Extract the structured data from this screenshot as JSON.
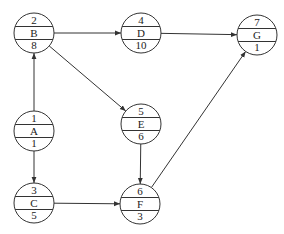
{
  "diagram": {
    "type": "activity-on-node network",
    "nodes": [
      {
        "id": "A",
        "number": "1",
        "name": "A",
        "duration": "1",
        "cx": 34,
        "cy": 131
      },
      {
        "id": "B",
        "number": "2",
        "name": "B",
        "duration": "8",
        "cx": 34,
        "cy": 33
      },
      {
        "id": "C",
        "number": "3",
        "name": "C",
        "duration": "5",
        "cx": 34,
        "cy": 203
      },
      {
        "id": "D",
        "number": "4",
        "name": "D",
        "duration": "10",
        "cx": 141,
        "cy": 33
      },
      {
        "id": "E",
        "number": "5",
        "name": "E",
        "duration": "6",
        "cx": 141,
        "cy": 124
      },
      {
        "id": "F",
        "number": "6",
        "name": "F",
        "duration": "3",
        "cx": 140,
        "cy": 204
      },
      {
        "id": "G",
        "number": "7",
        "name": "G",
        "duration": "1",
        "cx": 257,
        "cy": 35
      }
    ],
    "edges": [
      {
        "from": "A",
        "to": "B"
      },
      {
        "from": "A",
        "to": "C"
      },
      {
        "from": "B",
        "to": "D"
      },
      {
        "from": "B",
        "to": "E"
      },
      {
        "from": "D",
        "to": "G"
      },
      {
        "from": "E",
        "to": "F"
      },
      {
        "from": "C",
        "to": "F"
      },
      {
        "from": "F",
        "to": "G"
      }
    ],
    "node_radius": 20,
    "colors": {
      "stroke": "#333333",
      "background": "#ffffff",
      "text": "#222222"
    }
  }
}
